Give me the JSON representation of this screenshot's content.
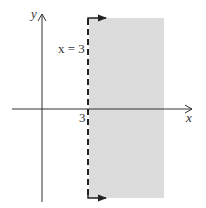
{
  "diagram": {
    "type": "inequality-graph",
    "inequality": "x > 3",
    "boundary_label": "x = 3",
    "boundary_style": "dashed",
    "x_axis_label": "x",
    "y_axis_label": "y",
    "tick_label": "3",
    "shaded_region": "right of x = 3",
    "colors": {
      "shade": "#dcdcdc",
      "axis": "#333333",
      "boundary": "#222222"
    }
  }
}
